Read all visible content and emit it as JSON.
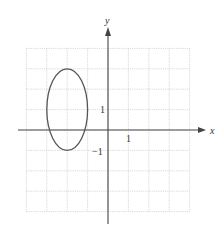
{
  "figure": {
    "x_axis_label": "x",
    "y_axis_label": "y",
    "tick_labels": {
      "x_pos_1": "1",
      "y_pos_1": "1",
      "y_neg_1": "−1"
    },
    "grid": {
      "xmin": -4,
      "xmax": 4,
      "ymin": -4,
      "ymax": 4,
      "step": 1
    },
    "origin_px": {
      "x": 108,
      "y": 130
    },
    "unit_px": 20.4,
    "ellipse": {
      "equation": "(x+2)^2 + (y-1)^2/4 = 1",
      "center": [
        -2,
        1
      ],
      "semi_axis_x": 1,
      "semi_axis_y": 2
    },
    "colors": {
      "grid": "#cfcfcf",
      "axis": "#444444",
      "curve": "#555555"
    }
  }
}
